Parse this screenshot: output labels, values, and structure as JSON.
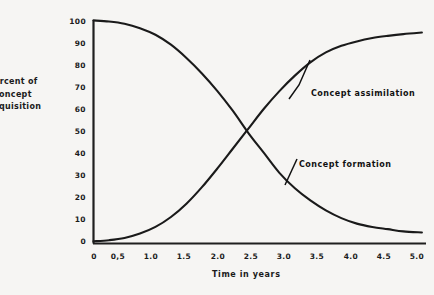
{
  "chart_data": {
    "type": "line",
    "title": "",
    "xlabel": "Time in years",
    "ylabel": "ercent of\nconcept\ncquisition",
    "ylabel_lines": [
      "ercent of",
      "concept",
      "cquisition"
    ],
    "xlim": [
      0,
      5.35
    ],
    "ylim": [
      0,
      103
    ],
    "grid": false,
    "legend": "none (inline annotations)",
    "xticks": [
      "0",
      "0,5",
      "1.0",
      "1.5",
      "2.0",
      "2.5",
      "3.0",
      "3.5",
      "4.0",
      "4.5",
      "5.0"
    ],
    "xtick_values": [
      0,
      0.5,
      1.0,
      1.5,
      2.0,
      2.5,
      3.0,
      3.5,
      4.0,
      4.5,
      5.0
    ],
    "yticks": [
      "0",
      "10",
      "20",
      "30",
      "40",
      "50",
      "60",
      "70",
      "80",
      "90",
      "100"
    ],
    "ytick_values": [
      0,
      10,
      20,
      30,
      40,
      50,
      60,
      70,
      80,
      90,
      100
    ],
    "series": [
      {
        "name": "Concept formation",
        "annotation": "Concept formation",
        "x": [
          0,
          0.25,
          0.5,
          0.75,
          1.0,
          1.25,
          1.5,
          1.75,
          2.0,
          2.25,
          2.5,
          2.75,
          3.0,
          3.25,
          3.5,
          3.75,
          4.0,
          4.25,
          4.5,
          4.75,
          5.0,
          5.3
        ],
        "values": [
          101,
          100.5,
          99.5,
          97.5,
          94.5,
          90,
          84,
          77,
          69,
          60,
          50,
          41,
          32,
          25,
          19.5,
          15,
          11.5,
          9,
          7.5,
          6.5,
          5.5,
          5
        ]
      },
      {
        "name": "Concept assimilation",
        "annotation": "Concept assimilation",
        "x": [
          0,
          0.25,
          0.5,
          0.75,
          1.0,
          1.25,
          1.5,
          1.75,
          2.0,
          2.25,
          2.5,
          2.75,
          3.0,
          3.25,
          3.5,
          3.75,
          4.0,
          4.25,
          4.5,
          4.75,
          5.0,
          5.3
        ],
        "values": [
          1,
          1.5,
          2.5,
          4.5,
          7.5,
          12,
          18,
          25.5,
          34,
          43,
          52,
          61,
          69,
          76,
          82,
          86.5,
          89.5,
          91.5,
          93,
          94,
          94.8,
          95.5
        ]
      }
    ],
    "crossing_point": {
      "x": 2.47,
      "y": 48
    },
    "colors": {
      "line": "#1a1a1a",
      "axis": "#1f1f1f",
      "background": "#f6f5f3",
      "text": "#161616"
    }
  }
}
